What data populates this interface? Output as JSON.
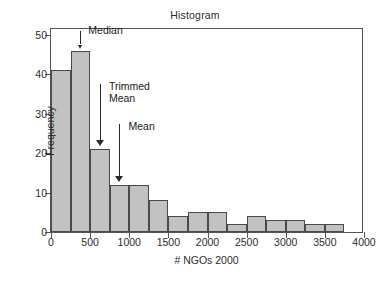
{
  "chart_data": {
    "type": "bar",
    "title": "Histogram",
    "xlabel": "# NGOs 2000",
    "ylabel": "Frequency",
    "xlim": [
      0,
      4000
    ],
    "ylim": [
      0,
      52
    ],
    "grid": false,
    "legend": "none",
    "bin_width": 250,
    "xticks": [
      0,
      500,
      1000,
      1500,
      2000,
      2500,
      3000,
      3500,
      4000
    ],
    "xtick_labels": [
      "0",
      "500",
      "1000",
      "1500",
      "2000",
      "2500",
      "3000",
      "3500",
      "4000"
    ],
    "yticks": [
      0,
      10,
      20,
      30,
      40,
      50
    ],
    "ytick_labels": [
      "0",
      "10",
      "20",
      "30",
      "40",
      "50"
    ],
    "bars": [
      {
        "bin_start": 0,
        "bin_end": 250,
        "value": 41
      },
      {
        "bin_start": 250,
        "bin_end": 500,
        "value": 46
      },
      {
        "bin_start": 500,
        "bin_end": 750,
        "value": 21
      },
      {
        "bin_start": 750,
        "bin_end": 1000,
        "value": 12
      },
      {
        "bin_start": 1000,
        "bin_end": 1250,
        "value": 12
      },
      {
        "bin_start": 1250,
        "bin_end": 1500,
        "value": 8
      },
      {
        "bin_start": 1500,
        "bin_end": 1750,
        "value": 4
      },
      {
        "bin_start": 1750,
        "bin_end": 2000,
        "value": 5
      },
      {
        "bin_start": 2000,
        "bin_end": 2250,
        "value": 5
      },
      {
        "bin_start": 2250,
        "bin_end": 2500,
        "value": 2
      },
      {
        "bin_start": 2500,
        "bin_end": 2750,
        "value": 4
      },
      {
        "bin_start": 2750,
        "bin_end": 3000,
        "value": 3
      },
      {
        "bin_start": 3000,
        "bin_end": 3250,
        "value": 3
      },
      {
        "bin_start": 3250,
        "bin_end": 3500,
        "value": 2
      },
      {
        "bin_start": 3500,
        "bin_end": 3750,
        "value": 2
      }
    ],
    "annotations": [
      {
        "label": "Median",
        "x": 375,
        "arrow_top_y": 51.5,
        "arrow_bottom_y": 46.8
      },
      {
        "label": "Trimmed\nMean",
        "x": 625,
        "arrow_top_y": 38.0,
        "arrow_bottom_y": 22.2
      },
      {
        "label": "Mean",
        "x": 875,
        "arrow_top_y": 28.0,
        "arrow_bottom_y": 13.2
      }
    ],
    "colors": {
      "bar_fill": "#c2c2c2",
      "bar_edge": "#4a4a4a",
      "axis": "#555555",
      "text": "#1a1a1a",
      "background": "#ffffff"
    }
  }
}
